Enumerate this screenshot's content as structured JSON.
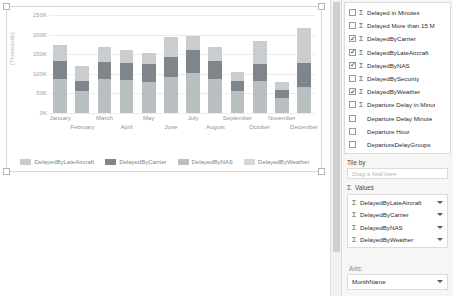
{
  "chart_data": {
    "type": "bar",
    "stacked": true,
    "title": "",
    "xlabel": "",
    "ylabel": "(Thousands)",
    "ylim": [
      0,
      250000
    ],
    "ytick_labels": [
      "0K",
      "50K",
      "100K",
      "150K",
      "200K",
      "250K"
    ],
    "ytick_values": [
      0,
      50000,
      100000,
      150000,
      200000,
      250000
    ],
    "grid": true,
    "legend_position": "bottom",
    "categories": [
      "January",
      "February",
      "March",
      "April",
      "May",
      "June",
      "July",
      "August",
      "September",
      "October",
      "November",
      "December"
    ],
    "series": [
      {
        "name": "DelayedByNAS",
        "color": "#b9bec1",
        "values": [
          88000,
          56000,
          86000,
          83000,
          80000,
          92000,
          103000,
          86000,
          56000,
          82000,
          38000,
          67000
        ]
      },
      {
        "name": "DelayedByCarrier",
        "color": "#7f858a",
        "values": [
          45000,
          25000,
          45000,
          44000,
          44000,
          52000,
          57000,
          47000,
          26000,
          44000,
          20000,
          61000
        ]
      },
      {
        "name": "DelayedByLateAircraft",
        "color": "#c9cdd0",
        "values": [
          40000,
          39000,
          38000,
          33000,
          30000,
          51000,
          36000,
          36000,
          22000,
          58000,
          22000,
          88000
        ]
      },
      {
        "name": "DelayedByWeather",
        "color": "#d5d8da",
        "values": [
          0,
          0,
          0,
          0,
          0,
          0,
          0,
          0,
          0,
          0,
          0,
          0
        ]
      }
    ],
    "legend": [
      {
        "label": "DelayedByLateAircraft",
        "color": "#c9cdd0"
      },
      {
        "label": "DelayedByCarrier",
        "color": "#7f858a"
      },
      {
        "label": "DelayedByNAS",
        "color": "#b9bec1"
      },
      {
        "label": "DelayedByWeather",
        "color": "#d5d8da"
      }
    ]
  },
  "pane": {
    "field_list": [
      {
        "label": "Delayed in Minutes",
        "checked": false,
        "aggregate": true
      },
      {
        "label": "Delayed More than 15 M",
        "checked": false,
        "aggregate": true
      },
      {
        "label": "DelayedByCarrier",
        "checked": true,
        "aggregate": true
      },
      {
        "label": "DelayedByLateAircraft",
        "checked": true,
        "aggregate": true
      },
      {
        "label": "DelayedByNAS",
        "checked": true,
        "aggregate": true
      },
      {
        "label": "DelayedBySecurity",
        "checked": false,
        "aggregate": true
      },
      {
        "label": "DelayedByWeather",
        "checked": true,
        "aggregate": true
      },
      {
        "label": "Departure Delay in Minut",
        "checked": false,
        "aggregate": true
      },
      {
        "label": "Departure Delay Minute",
        "checked": false,
        "aggregate": false
      },
      {
        "label": "Departure Hour",
        "checked": false,
        "aggregate": false
      },
      {
        "label": "DepartureDelayGroups",
        "checked": false,
        "aggregate": false
      }
    ],
    "tile_by": {
      "title": "Tile by",
      "placeholder": "Drag a field here"
    },
    "values": {
      "title": "Values",
      "items": [
        {
          "label": "DelayedByLateAircraft"
        },
        {
          "label": "DelayedByCarrier"
        },
        {
          "label": "DelayedByNAS"
        },
        {
          "label": "DelayedByWeather"
        }
      ]
    },
    "axis": {
      "title": "Axis:",
      "selected": "MonthName"
    }
  }
}
